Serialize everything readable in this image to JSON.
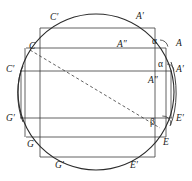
{
  "figure": {
    "kind": "geometry-diagram",
    "width": 192,
    "height": 181,
    "background_color": "#ffffff",
    "stroke_color": "#3a3a3a",
    "circle_stroke_color": "#2b2b2b",
    "text_color": "#1b1b1b"
  },
  "circle": {
    "name": "main-circle",
    "cx": 96,
    "cy": 92,
    "r": 78
  },
  "side_arcs": [
    {
      "name": "left-lens-arc",
      "d": "M 23 66 C 16 80 16 106 23 122"
    },
    {
      "name": "right-lens-arc",
      "d": "M 171 62 C 178 80 178 108 170 126"
    }
  ],
  "horizontal_lines": [
    {
      "name": "line-top-rect-top",
      "y": 28,
      "x1": 40,
      "x2": 155
    },
    {
      "name": "line-c-to-a2",
      "y": 48,
      "x1": 26,
      "x2": 166
    },
    {
      "name": "line-c2-to-a3",
      "y": 71,
      "x1": 20,
      "x2": 172
    },
    {
      "name": "line-g2-to-e2",
      "y": 118,
      "x1": 20,
      "x2": 172
    },
    {
      "name": "line-g-to-e",
      "y": 137,
      "x1": 26,
      "x2": 166
    },
    {
      "name": "line-bottom-rect-bottom",
      "y": 157,
      "x1": 40,
      "x2": 155
    }
  ],
  "vertical_lines": [
    {
      "name": "vline-outer-left",
      "x": 25,
      "y1": 48,
      "y2": 137
    },
    {
      "name": "vline-inner-left",
      "x": 40,
      "y1": 28,
      "y2": 157
    },
    {
      "name": "vline-inner-right",
      "x": 155,
      "y1": 28,
      "y2": 157
    },
    {
      "name": "vline-outer-right",
      "x": 166,
      "y1": 48,
      "y2": 137
    },
    {
      "name": "vline-far-left",
      "x": 21,
      "y1": 71,
      "y2": 118
    },
    {
      "name": "vline-far-right",
      "x": 171,
      "y1": 71,
      "y2": 118
    }
  ],
  "dashed_line": {
    "name": "diagonal-c-to-e",
    "x1": 30,
    "y1": 50,
    "x2": 160,
    "y2": 128
  },
  "angle_arcs": [
    {
      "name": "alpha-arc-upper",
      "cx": 160,
      "cy": 48,
      "r": 8,
      "start": -90,
      "end": -10
    },
    {
      "name": "alpha-arc-lower",
      "cx": 167,
      "cy": 71,
      "r": 7,
      "start": -90,
      "end": -5
    },
    {
      "name": "beta-arc",
      "cx": 163,
      "cy": 124,
      "r": 8,
      "start": -95,
      "end": 5
    }
  ],
  "labels": {
    "vertices": [
      {
        "name": "label-C-prime-top",
        "text": "C′",
        "x": 50,
        "y": 13
      },
      {
        "name": "label-A-prime-top",
        "text": "A′",
        "x": 136,
        "y": 12
      },
      {
        "name": "label-A-double-prime-upper",
        "text": "A″",
        "x": 117,
        "y": 40
      },
      {
        "name": "label-A-right",
        "text": "A",
        "x": 176,
        "y": 39
      },
      {
        "name": "label-C-upper-left",
        "text": "C",
        "x": 29,
        "y": 42
      },
      {
        "name": "label-C-prime-left",
        "text": "C′",
        "x": 6,
        "y": 65
      },
      {
        "name": "label-A-prime-right",
        "text": "A′",
        "x": 176,
        "y": 65
      },
      {
        "name": "label-A-double-prime-lower",
        "text": "A″",
        "x": 148,
        "y": 76
      },
      {
        "name": "label-G-prime-left",
        "text": "G′",
        "x": 6,
        "y": 114
      },
      {
        "name": "label-E-prime-right",
        "text": "E′",
        "x": 176,
        "y": 114
      },
      {
        "name": "label-G-lower-left",
        "text": "G",
        "x": 27,
        "y": 140
      },
      {
        "name": "label-E-lower-right",
        "text": "E",
        "x": 163,
        "y": 138
      },
      {
        "name": "label-G-prime-bottom",
        "text": "G′",
        "x": 55,
        "y": 161
      },
      {
        "name": "label-E-prime-bottom",
        "text": "E′",
        "x": 130,
        "y": 161
      }
    ],
    "angles": [
      {
        "name": "label-alpha-upper",
        "text": "α",
        "x": 152,
        "y": 37
      },
      {
        "name": "label-alpha-lower",
        "text": "α",
        "x": 158,
        "y": 60
      },
      {
        "name": "label-beta",
        "text": "β",
        "x": 150,
        "y": 118
      }
    ]
  }
}
